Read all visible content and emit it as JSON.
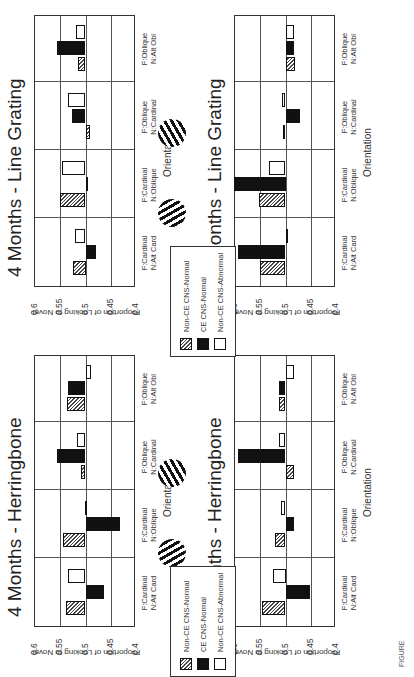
{
  "legend": {
    "items": [
      {
        "label": "Non-CE CNS-Normal",
        "style": "hatch"
      },
      {
        "label": "CE CNS-Normal",
        "style": "black"
      },
      {
        "label": "Non-CE CNS-Abnormal",
        "style": "white"
      }
    ]
  },
  "caption": "FIGURE",
  "chart_data": [
    {
      "type": "bar",
      "title": "4 Months - Herringbone",
      "xlabel": "Orientation",
      "ylabel": "Proportion of Looking to Novel",
      "ylim": [
        0.4,
        0.6
      ],
      "yticks": [
        "0.6",
        "0.55",
        "0.5",
        "0.45",
        "0.4"
      ],
      "baseline": 0.5,
      "grid": true,
      "categories": [
        "F:Cardinal N:Alt Card",
        "F:Cardinal N:Oblique",
        "F:Oblique N:Cardinal",
        "F:Oblique N:Alt Obl"
      ],
      "series": [
        {
          "name": "Non-CE CNS-Normal",
          "values": [
            0.539,
            0.545,
            0.509,
            0.536
          ]
        },
        {
          "name": "CE CNS-Normal",
          "values": [
            0.464,
            0.432,
            0.557,
            0.535
          ]
        },
        {
          "name": "Non-CE CNS-Abnormal",
          "values": [
            0.534,
            0.501,
            0.517,
            0.49
          ]
        }
      ]
    },
    {
      "type": "bar",
      "title": "4 Months - Line Grating",
      "xlabel": "Orientation",
      "ylabel": "Proportion of Looking to Novel",
      "ylim": [
        0.4,
        0.6
      ],
      "yticks": [
        "0.6",
        "0.55",
        "0.5",
        "0.45",
        "0.4"
      ],
      "baseline": 0.5,
      "grid": true,
      "categories": [
        "F:Cardinal N:Alt Card",
        "F:Cardinal N:Oblique",
        "F:Oblique N:Cardinal",
        "F:Oblique N:Alt Obl"
      ],
      "series": [
        {
          "name": "Non-CE CNS-Normal",
          "values": [
            0.525,
            0.551,
            0.492,
            0.515
          ]
        },
        {
          "name": "CE CNS-Normal",
          "values": [
            0.479,
            0.495,
            0.527,
            0.556
          ]
        },
        {
          "name": "Non-CE CNS-Abnormal",
          "values": [
            0.521,
            0.546,
            0.534,
            0.518
          ]
        }
      ]
    },
    {
      "type": "bar",
      "title": "7 Months - Herringbone",
      "xlabel": "Orientation",
      "ylabel": "Proportion of Looking to Novel",
      "ylim": [
        0.4,
        0.6
      ],
      "yticks": [
        "0.6",
        "0.55",
        "0.5",
        "0.45",
        "0.4"
      ],
      "baseline": 0.5,
      "grid": true,
      "categories": [
        "F:Cardinal N:Alt Card",
        "F:Cardinal N:Oblique",
        "F:Oblique N:Cardinal",
        "F:Oblique N:Alt Obl"
      ],
      "series": [
        {
          "name": "Non-CE CNS-Normal",
          "values": [
            0.547,
            0.521,
            0.483,
            0.513
          ]
        },
        {
          "name": "CE CNS-Normal",
          "values": [
            0.452,
            0.483,
            0.594,
            0.513
          ]
        },
        {
          "name": "Non-CE CNS-Abnormal",
          "values": [
            0.525,
            0.508,
            0.512,
            0.483
          ]
        }
      ]
    },
    {
      "type": "bar",
      "title": "7 Months - Line Grating",
      "xlabel": "Orientation",
      "ylabel": "Proportion of Looking to Novel",
      "ylim": [
        0.4,
        0.6
      ],
      "yticks": [
        "0.6",
        "0.55",
        "0.5",
        "0.45",
        "0.4"
      ],
      "baseline": 0.5,
      "grid": true,
      "categories": [
        "F:Cardinal N:Alt Card",
        "F:Cardinal N:Oblique",
        "F:Oblique N:Cardinal",
        "F:Oblique N:Alt Obl"
      ],
      "series": [
        {
          "name": "Non-CE CNS-Normal",
          "values": [
            0.551,
            0.553,
            0.505,
            0.481
          ]
        },
        {
          "name": "CE CNS-Normal",
          "values": [
            0.595,
            0.603,
            0.471,
            0.484
          ]
        },
        {
          "name": "Non-CE CNS-Abnormal",
          "values": [
            0.5,
            0.533,
            0.507,
            0.484
          ]
        }
      ]
    }
  ],
  "panels": [
    {
      "title": "4 Months - Herringbone",
      "xlabel": "Orientation",
      "ylabel": "Proportion of Looking to Novel",
      "cat0a": "F:Cardinal",
      "cat0b": "N:Alt Card",
      "cat1a": "F:Cardinal",
      "cat1b": "N:Oblique",
      "cat2a": "F:Oblique",
      "cat2b": "N:Cardinal",
      "cat3a": "F:Oblique",
      "cat3b": "N:Alt Obl"
    },
    {
      "title": "4 Months - Line Grating",
      "xlabel": "Orientation",
      "ylabel": "Proportion of Looking to Novel",
      "cat0a": "F:Cardinal",
      "cat0b": "N:Alt Card",
      "cat1a": "F:Cardinal",
      "cat1b": "N:Oblique",
      "cat2a": "F:Oblique",
      "cat2b": "N:Cardinal",
      "cat3a": "F:Oblique",
      "cat3b": "N:Alt Obl"
    },
    {
      "title": "7 Months - Herringbone",
      "xlabel": "Orientation",
      "ylabel": "Proportion of Looking to Novel",
      "cat0a": "F:Cardinal",
      "cat0b": "N:Alt Card",
      "cat1a": "F:Cardinal",
      "cat1b": "N:Oblique",
      "cat2a": "F:Oblique",
      "cat2b": "N:Cardinal",
      "cat3a": "F:Oblique",
      "cat3b": "N:Alt Obl"
    },
    {
      "title": "7 Months - Line Grating",
      "xlabel": "Orientation",
      "ylabel": "Proportion of Looking to Novel",
      "cat0a": "F:Cardinal",
      "cat0b": "N:Alt Card",
      "cat1a": "F:Cardinal",
      "cat1b": "N:Oblique",
      "cat2a": "F:Oblique",
      "cat2b": "N:Cardinal",
      "cat3a": "F:Oblique",
      "cat3b": "N:Alt Obl"
    }
  ],
  "yticks": [
    "0.6",
    "0.55",
    "0.5",
    "0.45",
    "0.4"
  ]
}
